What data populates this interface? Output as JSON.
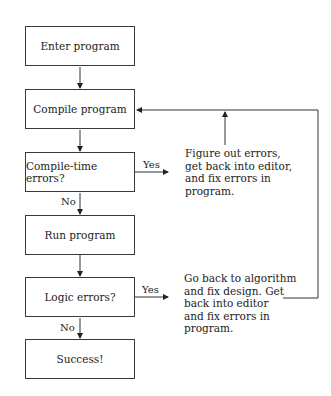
{
  "flowchart": {
    "nodes": [
      {
        "id": "enter",
        "label": "Enter program",
        "type": "process"
      },
      {
        "id": "compile",
        "label": "Compile program",
        "type": "process"
      },
      {
        "id": "compile_errors",
        "label": "Compile-time errors?",
        "type": "decision"
      },
      {
        "id": "run",
        "label": "Run program",
        "type": "process"
      },
      {
        "id": "logic_errors",
        "label": "Logic errors?",
        "type": "decision"
      },
      {
        "id": "success",
        "label": "Success!",
        "type": "terminal"
      }
    ],
    "notes": {
      "compile_fix": "Figure out errors,\nget back into editor,\nand fix errors in\nprogram.",
      "logic_fix": "Go back to algorithm\nand fix design. Get\nback into editor\nand fix errors in\nprogram."
    },
    "edge_labels": {
      "compile_yes": "Yes",
      "compile_no": "No",
      "logic_yes": "Yes",
      "logic_no": "No"
    },
    "edges": [
      {
        "from": "enter",
        "to": "compile"
      },
      {
        "from": "compile",
        "to": "compile_errors"
      },
      {
        "from": "compile_errors",
        "to": "compile_fix",
        "label": "Yes"
      },
      {
        "from": "compile_fix",
        "to": "compile"
      },
      {
        "from": "compile_errors",
        "to": "run",
        "label": "No"
      },
      {
        "from": "run",
        "to": "logic_errors"
      },
      {
        "from": "logic_errors",
        "to": "logic_fix",
        "label": "Yes"
      },
      {
        "from": "logic_fix",
        "to": "compile"
      },
      {
        "from": "logic_errors",
        "to": "success",
        "label": "No"
      }
    ]
  }
}
